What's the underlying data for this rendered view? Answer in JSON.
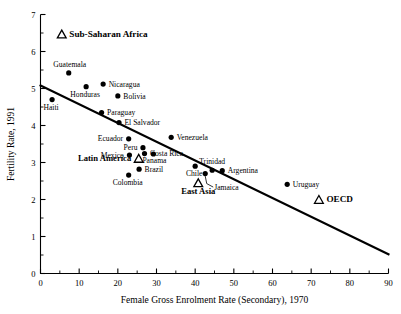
{
  "chart_data": {
    "type": "scatter",
    "title": "",
    "xlabel": "Female Gross Enrolment Rate (Secondary), 1970",
    "ylabel": "Fertility Rate, 1991",
    "xlim": [
      0,
      90
    ],
    "ylim": [
      0,
      7
    ],
    "xticks": [
      0,
      10,
      20,
      30,
      40,
      50,
      60,
      70,
      80,
      90
    ],
    "xticks_minor": [
      5,
      15,
      25,
      35,
      45,
      55,
      65,
      75,
      85
    ],
    "yticks": [
      0,
      1,
      2,
      3,
      4,
      5,
      6,
      7
    ],
    "yticks_minor": [
      0.5,
      1.5,
      2.5,
      3.5,
      4.5,
      5.5,
      6.5
    ],
    "grid": false,
    "legend": "none",
    "xtick_labels": [
      "0",
      "10",
      "20",
      "30",
      "40",
      "50",
      "60",
      "70",
      "80",
      "90"
    ],
    "ytick_labels": [
      "0",
      "1",
      "2",
      "3",
      "4",
      "5",
      "6",
      "7"
    ],
    "trendline": {
      "x0": 0,
      "y0": 5.08,
      "x1": 90,
      "y1": 0.52
    },
    "points": [
      {
        "name": "Haiti",
        "x": 3.0,
        "y": 4.7,
        "marker": "circle",
        "label_pos": "below-left"
      },
      {
        "name": "Guatemala",
        "x": 7.3,
        "y": 5.42,
        "marker": "circle",
        "label_pos": "above-left"
      },
      {
        "name": "Honduras",
        "x": 11.8,
        "y": 5.05,
        "marker": "circle",
        "label_pos": "below-left"
      },
      {
        "name": "Nicaragua",
        "x": 16.2,
        "y": 5.12,
        "marker": "circle",
        "label_pos": "right"
      },
      {
        "name": "Bolivia",
        "x": 20.0,
        "y": 4.8,
        "marker": "circle",
        "label_pos": "right"
      },
      {
        "name": "Paraguay",
        "x": 15.8,
        "y": 4.35,
        "marker": "circle",
        "label_pos": "right"
      },
      {
        "name": "El Salvador",
        "x": 20.3,
        "y": 4.08,
        "marker": "circle",
        "label_pos": "right"
      },
      {
        "name": "Ecuador",
        "x": 22.8,
        "y": 3.64,
        "marker": "circle",
        "label_pos": "left"
      },
      {
        "name": "Venezuela",
        "x": 33.8,
        "y": 3.68,
        "marker": "circle",
        "label_pos": "right"
      },
      {
        "name": "Peru",
        "x": 26.5,
        "y": 3.4,
        "marker": "circle",
        "label_pos": "left"
      },
      {
        "name": "Mexico",
        "x": 23.0,
        "y": 3.2,
        "marker": "circle",
        "label_pos": "left"
      },
      {
        "name": "Costa Rica",
        "x": 26.9,
        "y": 3.24,
        "marker": "circle",
        "label_pos": "right"
      },
      {
        "name": "Panama",
        "x": 29.2,
        "y": 3.23,
        "marker": "circle",
        "label_pos": "below-right"
      },
      {
        "name": "Brazil",
        "x": 25.5,
        "y": 2.82,
        "marker": "circle",
        "label_pos": "right"
      },
      {
        "name": "Colombia",
        "x": 22.8,
        "y": 2.66,
        "marker": "circle",
        "label_pos": "below-left"
      },
      {
        "name": "Chile",
        "x": 40.0,
        "y": 2.9,
        "marker": "circle",
        "label_pos": "below-left"
      },
      {
        "name": "Trinidad",
        "x": 44.4,
        "y": 2.79,
        "marker": "circle",
        "label_pos": "above"
      },
      {
        "name": "Argentina",
        "x": 47.0,
        "y": 2.78,
        "marker": "circle",
        "label_pos": "right"
      },
      {
        "name": "Jamaica",
        "x": 42.6,
        "y": 2.7,
        "marker": "circle",
        "label_pos": "leader-below"
      },
      {
        "name": "Uruguay",
        "x": 63.8,
        "y": 2.41,
        "marker": "circle",
        "label_pos": "right"
      },
      {
        "name": "Sub-Saharan Africa",
        "x": 5.5,
        "y": 6.46,
        "marker": "triangle",
        "label_pos": "right",
        "emphasis": "bold"
      },
      {
        "name": "Latin America",
        "x": 25.4,
        "y": 3.1,
        "marker": "triangle",
        "label_pos": "left",
        "emphasis": "bold"
      },
      {
        "name": "East Asia",
        "x": 40.8,
        "y": 2.44,
        "marker": "triangle",
        "label_pos": "below",
        "emphasis": "bold"
      },
      {
        "name": "OECD",
        "x": 72.0,
        "y": 1.99,
        "marker": "triangle",
        "label_pos": "right",
        "emphasis": "bold"
      }
    ]
  }
}
